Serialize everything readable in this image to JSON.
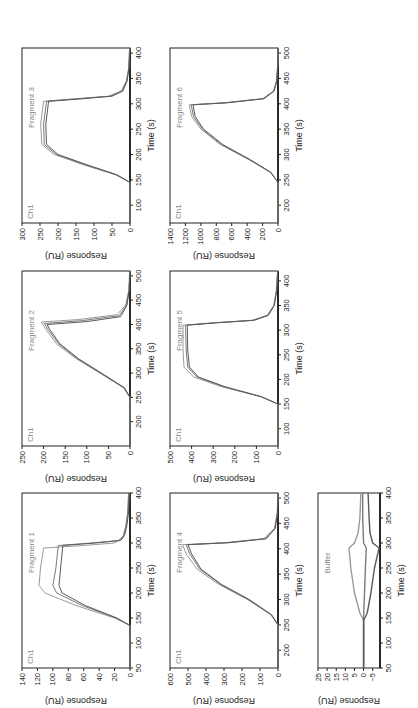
{
  "figure": {
    "orientation": "rotated 90 degrees counter-clockwise",
    "panel_count": 7
  },
  "chart_data": [
    {
      "type": "line",
      "id": "fragment1",
      "title": "",
      "channel_label": "Ch1",
      "panel_label": "Fragment 1",
      "xlabel": "Time (s)",
      "ylabel": "Response (RU)",
      "xlim": [
        50,
        400
      ],
      "ylim": [
        0,
        140
      ],
      "xticks": [
        50,
        100,
        150,
        200,
        250,
        300,
        350,
        400
      ],
      "yticks": [
        0,
        20,
        40,
        60,
        80,
        100,
        120,
        140
      ],
      "series": [
        {
          "name": "curve 1",
          "x": [
            50,
            135,
            150,
            175,
            200,
            215,
            250,
            290,
            295,
            300,
            310,
            330,
            360,
            400
          ],
          "y": [
            0,
            0,
            20,
            70,
            110,
            118,
            116,
            112,
            60,
            20,
            10,
            6,
            3,
            1
          ]
        },
        {
          "name": "curve 2",
          "x": [
            50,
            135,
            150,
            175,
            200,
            215,
            250,
            295,
            300,
            305,
            315,
            335,
            360,
            400
          ],
          "y": [
            0,
            0,
            18,
            62,
            95,
            100,
            96,
            93,
            50,
            15,
            8,
            5,
            3,
            2
          ]
        },
        {
          "name": "curve 3",
          "x": [
            50,
            135,
            150,
            175,
            200,
            215,
            250,
            295,
            300,
            305,
            315,
            335,
            360,
            400
          ],
          "y": [
            0,
            0,
            17,
            58,
            88,
            92,
            90,
            87,
            45,
            12,
            7,
            4,
            2,
            1
          ]
        }
      ],
      "grid": false,
      "legend": "none"
    },
    {
      "type": "line",
      "id": "fragment2",
      "channel_label": "Ch1",
      "panel_label": "Fragment 2",
      "xlabel": "Time (s)",
      "ylabel": "Response (RU)",
      "xlim": [
        150,
        510
      ],
      "ylim": [
        0,
        250
      ],
      "xticks": [
        200,
        250,
        300,
        350,
        400,
        450,
        500
      ],
      "yticks": [
        0,
        50,
        100,
        150,
        200,
        250
      ],
      "series": [
        {
          "name": "curve 1",
          "x": [
            150,
            250,
            270,
            300,
            330,
            360,
            390,
            405,
            410,
            420,
            440,
            470,
            510
          ],
          "y": [
            0,
            0,
            15,
            70,
            125,
            170,
            195,
            205,
            120,
            30,
            10,
            3,
            1
          ]
        },
        {
          "name": "curve 2",
          "x": [
            150,
            250,
            270,
            300,
            330,
            360,
            390,
            402,
            408,
            418,
            440,
            470,
            510
          ],
          "y": [
            0,
            0,
            14,
            68,
            122,
            165,
            190,
            198,
            110,
            25,
            8,
            2,
            0
          ]
        },
        {
          "name": "curve 3",
          "x": [
            150,
            250,
            270,
            300,
            330,
            360,
            390,
            400,
            406,
            416,
            440,
            470,
            510
          ],
          "y": [
            0,
            0,
            13,
            66,
            120,
            162,
            186,
            192,
            100,
            22,
            7,
            2,
            0
          ]
        }
      ],
      "grid": false,
      "legend": "none"
    },
    {
      "type": "line",
      "id": "fragment3",
      "channel_label": "Ch1",
      "panel_label": "Fragment 3",
      "xlabel": "Time (s)",
      "ylabel": "Response (RU)",
      "xlim": [
        65,
        410
      ],
      "ylim": [
        0,
        300
      ],
      "xticks": [
        100,
        150,
        200,
        250,
        300,
        350,
        400
      ],
      "yticks": [
        0,
        50,
        100,
        150,
        200,
        250,
        300
      ],
      "series": [
        {
          "name": "curve 1",
          "x": [
            65,
            145,
            160,
            180,
            200,
            220,
            260,
            305,
            310,
            315,
            325,
            345,
            370,
            410
          ],
          "y": [
            0,
            0,
            40,
            130,
            210,
            245,
            248,
            240,
            150,
            60,
            25,
            10,
            4,
            1
          ]
        },
        {
          "name": "curve 2",
          "x": [
            65,
            145,
            160,
            180,
            200,
            220,
            260,
            305,
            310,
            315,
            325,
            345,
            370,
            410
          ],
          "y": [
            0,
            0,
            38,
            125,
            205,
            238,
            240,
            232,
            140,
            55,
            22,
            9,
            3,
            1
          ]
        },
        {
          "name": "curve 3",
          "x": [
            65,
            145,
            160,
            180,
            200,
            220,
            260,
            305,
            310,
            315,
            325,
            345,
            370,
            410
          ],
          "y": [
            0,
            0,
            36,
            120,
            200,
            232,
            234,
            226,
            130,
            50,
            20,
            8,
            3,
            0
          ]
        }
      ],
      "grid": false,
      "legend": "none"
    },
    {
      "type": "line",
      "id": "fragment4",
      "channel_label": "Ch1",
      "panel_label": "Fragment 4",
      "xlabel": "Time (s)",
      "ylabel": "Response (RU)",
      "xlim": [
        165,
        510
      ],
      "ylim": [
        0,
        600
      ],
      "xticks": [
        200,
        250,
        300,
        350,
        400,
        450,
        500
      ],
      "yticks": [
        0,
        100,
        200,
        300,
        400,
        500,
        600
      ],
      "series": [
        {
          "name": "curve 1",
          "x": [
            165,
            250,
            270,
            300,
            330,
            360,
            390,
            408,
            412,
            420,
            440,
            470,
            510
          ],
          "y": [
            0,
            0,
            40,
            170,
            330,
            450,
            510,
            530,
            300,
            80,
            20,
            5,
            0
          ]
        },
        {
          "name": "curve 2",
          "x": [
            165,
            250,
            270,
            300,
            330,
            360,
            390,
            408,
            412,
            420,
            440,
            470,
            510
          ],
          "y": [
            0,
            0,
            38,
            165,
            320,
            435,
            490,
            510,
            280,
            70,
            18,
            4,
            0
          ]
        },
        {
          "name": "curve 3",
          "x": [
            165,
            250,
            270,
            300,
            330,
            360,
            390,
            408,
            412,
            420,
            440,
            470,
            510
          ],
          "y": [
            0,
            0,
            36,
            160,
            315,
            428,
            480,
            500,
            270,
            65,
            15,
            3,
            0
          ]
        }
      ],
      "grid": false,
      "legend": "none"
    },
    {
      "type": "line",
      "id": "fragment5",
      "channel_label": "Ch1",
      "panel_label": "Fragment 5",
      "xlabel": "Time (s)",
      "ylabel": "Response (RU)",
      "xlim": [
        65,
        420
      ],
      "ylim": [
        0,
        500
      ],
      "xticks": [
        100,
        150,
        200,
        250,
        300,
        350,
        400
      ],
      "yticks": [
        0,
        100,
        200,
        300,
        400,
        500
      ],
      "series": [
        {
          "name": "curve 1",
          "x": [
            65,
            150,
            165,
            185,
            205,
            225,
            260,
            310,
            315,
            320,
            330,
            350,
            380,
            420
          ],
          "y": [
            0,
            0,
            80,
            260,
            390,
            435,
            440,
            440,
            300,
            120,
            50,
            20,
            8,
            2
          ]
        },
        {
          "name": "curve 2",
          "x": [
            65,
            150,
            165,
            185,
            205,
            225,
            260,
            310,
            315,
            320,
            330,
            350,
            380,
            420
          ],
          "y": [
            0,
            0,
            78,
            250,
            375,
            418,
            425,
            428,
            290,
            115,
            48,
            18,
            7,
            2
          ]
        },
        {
          "name": "curve 3",
          "x": [
            65,
            150,
            165,
            185,
            205,
            225,
            260,
            310,
            315,
            320,
            330,
            350,
            380,
            420
          ],
          "y": [
            0,
            0,
            76,
            245,
            368,
            410,
            418,
            420,
            285,
            110,
            45,
            17,
            6,
            1
          ]
        }
      ],
      "grid": false,
      "legend": "none"
    },
    {
      "type": "line",
      "id": "fragment6",
      "channel_label": "Ch1",
      "panel_label": "Fragment 6",
      "xlabel": "Time (s)",
      "ylabel": "Response (RU)",
      "xlim": [
        165,
        510
      ],
      "ylim": [
        0,
        1400
      ],
      "xticks": [
        200,
        250,
        300,
        350,
        400,
        450,
        500
      ],
      "yticks": [
        0,
        200,
        400,
        600,
        800,
        1000,
        1200,
        1400
      ],
      "series": [
        {
          "name": "curve 1",
          "x": [
            165,
            245,
            265,
            290,
            320,
            350,
            375,
            398,
            402,
            410,
            425,
            445,
            475,
            510
          ],
          "y": [
            0,
            0,
            100,
            380,
            750,
            1000,
            1120,
            1150,
            700,
            200,
            60,
            20,
            5,
            0
          ]
        },
        {
          "name": "curve 2",
          "x": [
            165,
            245,
            265,
            290,
            320,
            350,
            375,
            398,
            402,
            410,
            425,
            445,
            475,
            510
          ],
          "y": [
            0,
            0,
            95,
            370,
            735,
            980,
            1095,
            1125,
            680,
            190,
            55,
            18,
            4,
            0
          ]
        },
        {
          "name": "curve 3",
          "x": [
            165,
            245,
            265,
            290,
            320,
            350,
            375,
            398,
            402,
            410,
            425,
            445,
            475,
            510
          ],
          "y": [
            0,
            0,
            92,
            362,
            720,
            965,
            1075,
            1100,
            660,
            180,
            50,
            15,
            4,
            0
          ]
        }
      ],
      "grid": false,
      "legend": "none"
    },
    {
      "type": "line",
      "id": "buffer",
      "channel_label": "",
      "panel_label": "Buffer",
      "xlabel": "Time (s)",
      "ylabel": "Response (RU)",
      "xlim": [
        50,
        400
      ],
      "ylim": [
        -9,
        25
      ],
      "xticks": [
        50,
        100,
        150,
        200,
        250,
        300,
        350,
        400
      ],
      "yticks": [
        -5,
        0,
        5,
        10,
        15,
        20,
        25
      ],
      "series": [
        {
          "name": "upper",
          "x": [
            50,
            100,
            145,
            160,
            200,
            250,
            290,
            300,
            320,
            350,
            400
          ],
          "y": [
            0,
            0,
            0,
            2,
            5,
            7,
            8,
            5,
            3,
            2,
            1.5
          ]
        },
        {
          "name": "middle",
          "x": [
            50,
            100,
            150,
            200,
            250,
            290,
            300,
            350,
            400
          ],
          "y": [
            0,
            0,
            0,
            -0.5,
            -1,
            -1.5,
            0,
            0.5,
            0.5
          ]
        },
        {
          "name": "lower",
          "x": [
            50,
            100,
            145,
            160,
            200,
            250,
            290,
            300,
            320,
            350,
            400
          ],
          "y": [
            0,
            0,
            0,
            -2,
            -4,
            -6,
            -8.5,
            -5,
            -3.5,
            -3,
            -2.5
          ]
        }
      ],
      "grid": false,
      "legend": "none"
    }
  ]
}
